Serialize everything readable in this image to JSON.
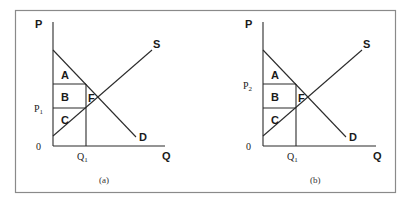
{
  "figure": {
    "border_color": "#8a8a8a",
    "line_color": "#2b2b2b",
    "panels": [
      {
        "id": "a",
        "caption": "(a)",
        "y_axis_label": "P",
        "x_axis_label": "Q",
        "origin_label": "0",
        "price_label": "P",
        "price_subscript": "1",
        "price_label_level": "lower",
        "quantity_label": "Q",
        "quantity_subscript": "1",
        "supply_label": "S",
        "demand_label": "D",
        "regions": [
          "A",
          "B",
          "C",
          "F"
        ]
      },
      {
        "id": "b",
        "caption": "(b)",
        "y_axis_label": "P",
        "x_axis_label": "Q",
        "origin_label": "0",
        "price_label": "P",
        "price_subscript": "2",
        "price_label_level": "upper",
        "quantity_label": "Q",
        "quantity_subscript": "1",
        "supply_label": "S",
        "demand_label": "D",
        "regions": [
          "A",
          "B",
          "C",
          "F"
        ]
      }
    ]
  }
}
